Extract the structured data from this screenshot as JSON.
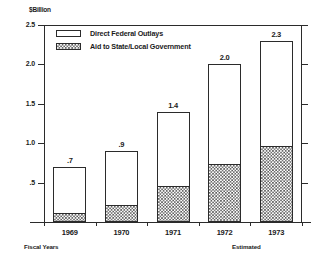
{
  "chart_data": {
    "type": "bar",
    "title": "",
    "subtitle": "",
    "unit_caption": "$Billion",
    "xlabel": "Fiscal Years",
    "ylabel": "",
    "ylim": [
      0,
      2.5
    ],
    "ytick_labels": [
      ".5",
      "1.0",
      "1.5",
      "2.0",
      "2.5"
    ],
    "ytick_values": [
      0.5,
      1.0,
      1.5,
      2.0,
      2.5
    ],
    "grid": false,
    "stacked": true,
    "legend_position": "upper-left-inside",
    "categories": [
      "1969",
      "1970",
      "1971",
      "1972",
      "1973"
    ],
    "totals": [
      0.7,
      0.9,
      1.4,
      2.0,
      2.3
    ],
    "total_labels": [
      ".7",
      ".9",
      "1.4",
      "2.0",
      "2.3"
    ],
    "series": [
      {
        "name": "Aid to State/Local Government",
        "pattern": "checkered-hatch",
        "values": [
          0.1,
          0.2,
          0.45,
          0.72,
          0.95
        ]
      },
      {
        "name": "Direct Federal Outlays",
        "pattern": "solid-white",
        "values": [
          0.6,
          0.7,
          0.95,
          1.28,
          1.35
        ]
      }
    ],
    "annotations": [
      {
        "text": "Fiscal Years",
        "position": "below-axis-left"
      },
      {
        "text": "Estimated",
        "position": "below-1973-category"
      }
    ],
    "colors": {
      "axis": "#2b2b2b",
      "bar_outline": "#2b2b2b",
      "hatch": "#5a5a5a",
      "background": "#ffffff",
      "text": "#1a1a1a"
    }
  },
  "legend": {
    "items": [
      {
        "label": "Direct Federal Outlays",
        "swatch": "open-rectangle-swatch"
      },
      {
        "label": "Aid to State/Local Government",
        "swatch": "hatched-rectangle-swatch"
      }
    ]
  }
}
